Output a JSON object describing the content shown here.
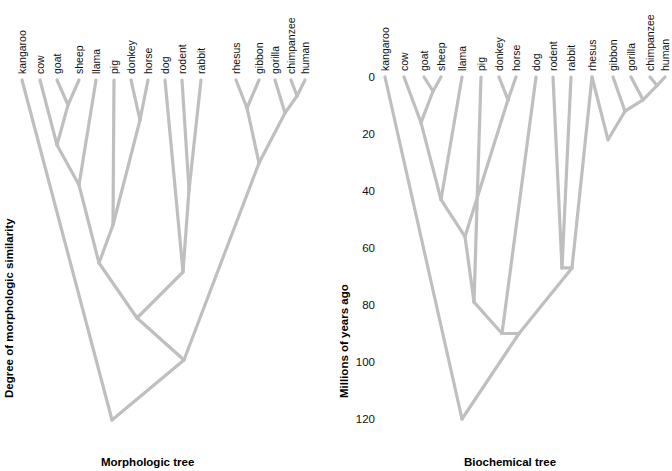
{
  "figure": {
    "width": 672,
    "height": 471,
    "background": "#ffffff",
    "branch_color": "#bfbfbf",
    "text_color": "#111111"
  },
  "panels": [
    {
      "id": "morphologic",
      "title": "Morphologic tree",
      "axis_title": "Degree of morphologic similarity",
      "axis_type": "qualitative",
      "ticks": [],
      "tick_labels": [],
      "origin_x": 18,
      "top_y": 80,
      "leaf_spacing": 20.2,
      "depth_scale": 2.85,
      "leaves": [
        {
          "name": "kangaroo",
          "x": 22
        },
        {
          "name": "cow",
          "x": 40
        },
        {
          "name": "goat",
          "x": 57
        },
        {
          "name": "sheep",
          "x": 79
        },
        {
          "name": "llama",
          "x": 96
        },
        {
          "name": "pig",
          "x": 114
        },
        {
          "name": "donkey",
          "x": 131
        },
        {
          "name": "horse",
          "x": 148
        },
        {
          "name": "dog",
          "x": 165
        },
        {
          "name": "rodent",
          "x": 182
        },
        {
          "name": "rabbit",
          "x": 201
        },
        {
          "name": "rhesus",
          "x": 236
        },
        {
          "name": "gibbon",
          "x": 259
        },
        {
          "name": "gorilla",
          "x": 275
        },
        {
          "name": "chimpanzee",
          "x": 291
        },
        {
          "name": "human",
          "x": 305
        }
      ],
      "nodes": [
        {
          "id": "goat_sheep",
          "children": [
            "goat",
            "sheep"
          ],
          "x": 68,
          "y": 105
        },
        {
          "id": "caprine_cow",
          "children": [
            "cow",
            "goat_sheep"
          ],
          "x": 57,
          "y": 145
        },
        {
          "id": "rum_llama",
          "children": [
            "caprine_cow",
            "llama"
          ],
          "x": 79,
          "y": 185
        },
        {
          "id": "donkey_horse",
          "children": [
            "donkey",
            "horse"
          ],
          "x": 140,
          "y": 120
        },
        {
          "id": "pig_equid",
          "children": [
            "pig",
            "donkey_horse"
          ],
          "x": 113,
          "y": 225
        },
        {
          "id": "ungulate",
          "children": [
            "rum_llama",
            "pig_equid"
          ],
          "x": 99,
          "y": 263
        },
        {
          "id": "rod_rab",
          "children": [
            "rodent",
            "rabbit"
          ],
          "x": 189,
          "y": 190
        },
        {
          "id": "dog_glires",
          "children": [
            "dog",
            "rod_rab"
          ],
          "x": 183,
          "y": 272
        },
        {
          "id": "rhe_gib",
          "children": [
            "rhesus",
            "gibbon"
          ],
          "x": 247,
          "y": 108
        },
        {
          "id": "chimp_human",
          "children": [
            "chimpanzee",
            "human"
          ],
          "x": 297,
          "y": 96
        },
        {
          "id": "gor_ch",
          "children": [
            "gorilla",
            "chimp_human"
          ],
          "x": 285,
          "y": 113
        },
        {
          "id": "hominoid",
          "children": [
            "rhe_gib",
            "gor_ch"
          ],
          "x": 259,
          "y": 163
        },
        {
          "id": "laurasia",
          "children": [
            "ungulate",
            "dog_glires"
          ],
          "x": 137,
          "y": 318
        },
        {
          "id": "placental",
          "children": [
            "laurasia",
            "hominoid"
          ],
          "x": 184,
          "y": 360
        },
        {
          "id": "root",
          "children": [
            "kangaroo",
            "placental"
          ],
          "x": 112,
          "y": 420
        }
      ]
    },
    {
      "id": "biochemical",
      "title": "Biochemical tree",
      "axis_title": "Millions of years ago",
      "axis_type": "numeric",
      "axis_unit": "Millions of years ago",
      "ticks": [
        0,
        20,
        40,
        60,
        80,
        100,
        120
      ],
      "tick_labels": [
        "0",
        "20",
        "40",
        "60",
        "80",
        "100",
        "120"
      ],
      "tick_y": [
        77,
        134,
        191,
        248,
        305,
        362,
        419
      ],
      "origin_x": 383,
      "top_y": 77,
      "depth_scale": 2.85,
      "leaves": [
        {
          "name": "kangaroo",
          "x": 385
        },
        {
          "name": "cow",
          "x": 404
        },
        {
          "name": "goat",
          "x": 424
        },
        {
          "name": "sheep",
          "x": 441
        },
        {
          "name": "llama",
          "x": 462
        },
        {
          "name": "pig",
          "x": 481
        },
        {
          "name": "donkey",
          "x": 499
        },
        {
          "name": "horse",
          "x": 516
        },
        {
          "name": "dog",
          "x": 536
        },
        {
          "name": "rodent",
          "x": 553
        },
        {
          "name": "rabbit",
          "x": 571
        },
        {
          "name": "rhesus",
          "x": 592
        },
        {
          "name": "gibbon",
          "x": 613
        },
        {
          "name": "gorilla",
          "x": 631
        },
        {
          "name": "chimpanzee",
          "x": 650
        },
        {
          "name": "human",
          "x": 665
        }
      ],
      "nodes": [
        {
          "id": "goat_sheep",
          "children": [
            "goat",
            "sheep"
          ],
          "x": 433,
          "y": 5
        },
        {
          "id": "caprine_cow",
          "children": [
            "cow",
            "goat_sheep"
          ],
          "x": 421,
          "y": 16
        },
        {
          "id": "rum_llama",
          "children": [
            "caprine_cow",
            "llama"
          ],
          "x": 441,
          "y": 43
        },
        {
          "id": "donkey_horse",
          "children": [
            "donkey",
            "horse"
          ],
          "x": 508,
          "y": 8
        },
        {
          "id": "ungulate",
          "children": [
            "rum_llama",
            "donkey_horse"
          ],
          "x": 465,
          "y": 56
        },
        {
          "id": "ungulate_pig",
          "children": [
            "ungulate",
            "pig"
          ],
          "x": 474,
          "y": 79
        },
        {
          "id": "rod_rab",
          "children": [
            "rodent",
            "rabbit"
          ],
          "x": 562,
          "y": 67
        },
        {
          "id": "glires_rhesus",
          "children": [
            "rod_rab",
            "rhesus"
          ],
          "x": 572,
          "y": 67
        },
        {
          "id": "chimp_human",
          "children": [
            "chimpanzee",
            "human"
          ],
          "x": 657,
          "y": 3
        },
        {
          "id": "gor_ch",
          "children": [
            "gorilla",
            "chimp_human"
          ],
          "x": 643,
          "y": 8
        },
        {
          "id": "gib_gor",
          "children": [
            "gibbon",
            "gor_ch"
          ],
          "x": 625,
          "y": 12
        },
        {
          "id": "catarrhine",
          "children": [
            "rhesus",
            "gib_gor"
          ],
          "x": 608,
          "y": 22
        },
        {
          "id": "boreo",
          "children": [
            "ungulate_pig",
            "dog"
          ],
          "x": 502,
          "y": 90
        },
        {
          "id": "placental",
          "children": [
            "boreo",
            "glires_rhesus"
          ],
          "x": 519,
          "y": 90
        },
        {
          "id": "root",
          "children": [
            "kangaroo",
            "placental"
          ],
          "x": 462,
          "y": 120
        }
      ]
    }
  ],
  "shared_taxa": [
    "kangaroo",
    "cow",
    "goat",
    "sheep",
    "llama",
    "pig",
    "donkey",
    "horse",
    "dog",
    "rodent",
    "rabbit",
    "rhesus",
    "gibbon",
    "gorilla",
    "chimpanzee",
    "human"
  ],
  "chart_data": {
    "type": "tree",
    "title": "",
    "subtitle": "",
    "panel_count": 2,
    "panel_titles": [
      "Morphologic tree",
      "Biochemical tree"
    ],
    "ylabels": [
      "Degree of morphologic similarity",
      "Millions of years ago"
    ],
    "taxa": [
      "kangaroo",
      "cow",
      "goat",
      "sheep",
      "llama",
      "pig",
      "donkey",
      "horse",
      "dog",
      "rodent",
      "rabbit",
      "rhesus",
      "gibbon",
      "gorilla",
      "chimpanzee",
      "human"
    ],
    "biochemical_divergence_times_mya": {
      "chimpanzee_human": 3,
      "gorilla_chimphuman": 8,
      "gibbon_greatapes": 12,
      "rhesus_apes": 22,
      "goat_sheep": 5,
      "cow_caprines": 16,
      "donkey_horse": 8,
      "llama_ruminants": 43,
      "artiodactyl_perissodactyl": 56,
      "pig_ungulates": 79,
      "rodent_rabbit": 67,
      "dog_ungulates": 90,
      "primates_others": 90,
      "kangaroo_placentals": 120
    },
    "ylim_biochemical": [
      0,
      125
    ],
    "yticks_biochemical": [
      0,
      20,
      40,
      60,
      80,
      100,
      120
    ],
    "grid": false,
    "legend": "none"
  }
}
